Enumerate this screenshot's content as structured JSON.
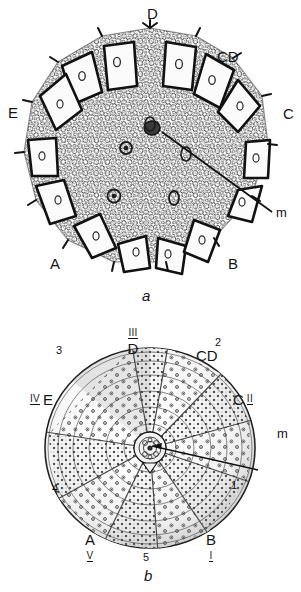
{
  "plate": {
    "title": "Echinoid apical system plate",
    "background_color": "#ffffff",
    "ink_color": "#141414"
  },
  "figures": [
    {
      "id": "a",
      "caption": "a",
      "kind": "apical-disc-detail",
      "description": "Detailed skeletal plate mosaic of the apical disc in plan view with tubercles and pore pairs",
      "pointer": {
        "label": "m",
        "meaning": "madreporite"
      },
      "labels": [
        {
          "text": "D",
          "role": "interambulacrum",
          "position": "top"
        },
        {
          "text": "CD",
          "role": "interambulacrum",
          "position": "upper-right"
        },
        {
          "text": "C",
          "role": "interambulacrum",
          "position": "right"
        },
        {
          "text": "B",
          "role": "interambulacrum",
          "position": "lower-right"
        },
        {
          "text": "A",
          "role": "interambulacrum",
          "position": "lower-left"
        },
        {
          "text": "E",
          "role": "interambulacrum",
          "position": "left"
        }
      ]
    },
    {
      "id": "b",
      "caption": "b",
      "kind": "whole-test-diagram",
      "description": "Whole corona in apical view showing five ambulacra and five interambulacra radiating from the apical disc",
      "pointer": {
        "label": "m",
        "meaning": "madreporite"
      },
      "letter_labels": [
        {
          "text": "D",
          "position": "top"
        },
        {
          "text": "CD",
          "position": "upper-right"
        },
        {
          "text": "C",
          "position": "right"
        },
        {
          "text": "B",
          "position": "lower-right"
        },
        {
          "text": "A",
          "position": "lower-left"
        },
        {
          "text": "E",
          "position": "left"
        }
      ],
      "roman_labels": [
        {
          "text": "III",
          "position": "top",
          "underlined": true
        },
        {
          "text": "II",
          "position": "right",
          "underlined": true
        },
        {
          "text": "I",
          "position": "lower-right",
          "underlined": true
        },
        {
          "text": "V",
          "position": "lower-left",
          "underlined": true
        },
        {
          "text": "IV",
          "position": "left",
          "underlined": true
        }
      ],
      "arabic_labels": [
        {
          "text": "2",
          "position": "upper-right"
        },
        {
          "text": "1",
          "position": "right-lower"
        },
        {
          "text": "5",
          "position": "bottom"
        },
        {
          "text": "4",
          "position": "lower-left"
        },
        {
          "text": "3",
          "position": "upper-left"
        }
      ]
    }
  ],
  "fig_a": {
    "label_D": "D",
    "label_CD": "CD",
    "label_C": "C",
    "label_B": "B",
    "label_A": "A",
    "label_E": "E",
    "label_m": "m",
    "caption": "a"
  },
  "fig_b": {
    "label_D": "D",
    "label_CD": "CD",
    "label_C": "C",
    "label_B": "B",
    "label_A": "A",
    "label_E": "E",
    "label_m": "m",
    "roman_III": "III",
    "roman_II": "II",
    "roman_I": "I",
    "roman_V": "V",
    "roman_IV": "IV",
    "num_1": "1",
    "num_2": "2",
    "num_3": "3",
    "num_4": "4",
    "num_5": "5",
    "caption": "b"
  }
}
